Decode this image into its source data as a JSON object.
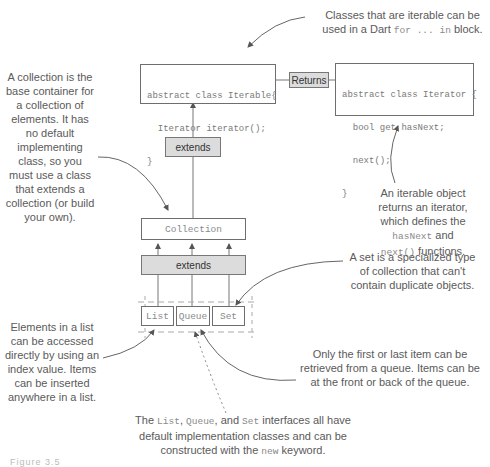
{
  "boxes": {
    "iterable": {
      "lines": [
        "abstract class Iterable{",
        "  Iterator iterator();",
        "}"
      ]
    },
    "iterator": {
      "lines": [
        "abstract class Iterator {",
        "  bool get hasNext;",
        "  next();",
        "}"
      ]
    },
    "collection": {
      "label": "Collection"
    },
    "list": {
      "label": "List"
    },
    "queue": {
      "label": "Queue"
    },
    "set": {
      "label": "Set"
    }
  },
  "connectors": {
    "returns": "Returns",
    "extends_top": "extends",
    "extends_bottom": "extends"
  },
  "annotations": {
    "iterable_note": {
      "text_before": "Classes that are iterable can be used in a Dart ",
      "code": "for ... in",
      "text_after": " block."
    },
    "collection_note": "A collection is the base container for a collection of elements. It has no default implementing class, so you must use a class that extends a collection (or build your own).",
    "iterator_note": {
      "line1": "An iterable object returns an iterator, which defines the",
      "code1": "hasNext",
      "mid": " and",
      "code2": "next()",
      "after": " functions."
    },
    "set_note": "A set is a specialized type of collection that can't contain duplicate objects.",
    "list_note": "Elements in a list can be accessed directly by using an index value. Items can be inserted anywhere in a list.",
    "queue_note": "Only the first or last item can be retrieved from a queue. Items can be at the front or back of the queue.",
    "bottom_note": {
      "t1": "The ",
      "c1": "List",
      "t2": ", ",
      "c2": "Queue",
      "t3": ", and ",
      "c3": "Set",
      "t4": " interfaces all have default implementation classes and can be constructed with the ",
      "c4": "new",
      "t5": " keyword."
    }
  },
  "caption": "Figure 3.5"
}
